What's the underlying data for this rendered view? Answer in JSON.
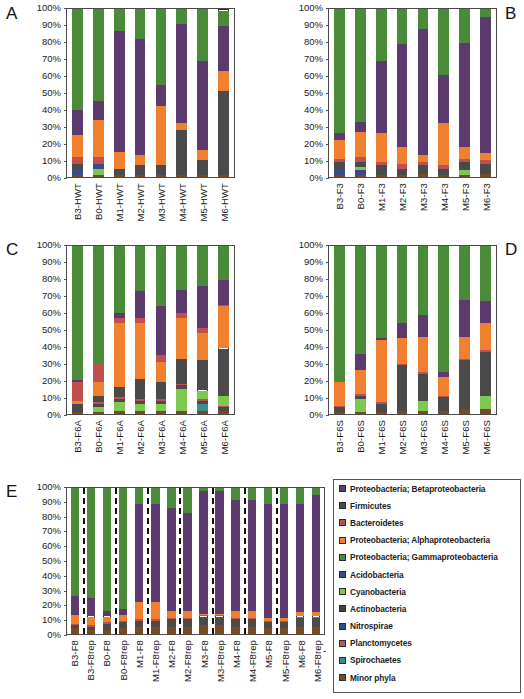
{
  "figure": {
    "panel_letters": [
      "A",
      "B",
      "C",
      "D",
      "E"
    ],
    "yticks": [
      "100%",
      "90%",
      "80%",
      "70%",
      "60%",
      "50%",
      "40%",
      "30%",
      "20%",
      "10%",
      "0%"
    ],
    "dash_marker": "-"
  },
  "legend": {
    "items": [
      {
        "label": "Proteobacteria; Betaproteobacteria",
        "color": "#5c3a6e",
        "key": "beta"
      },
      {
        "label": "Firmicutes",
        "color": "#4a4a4a",
        "key": "firmicutes"
      },
      {
        "label": "Bacteroidetes",
        "color": "#c0504d",
        "key": "bacteroidetes"
      },
      {
        "label": "Proteobacteria; Alphaproteobacteria",
        "color": "#f0802e",
        "key": "alpha"
      },
      {
        "label": "Proteobacteria; Gammaproteobacteria",
        "color": "#4a8b3a",
        "key": "gamma"
      },
      {
        "label": "Acidobacteria",
        "color": "#3b4a8c",
        "key": "acido"
      },
      {
        "label": "Cyanobacteria",
        "color": "#7ec850",
        "key": "cyano"
      },
      {
        "label": "Actinobacteria",
        "color": "#3f3f3f",
        "key": "actino"
      },
      {
        "label": "Nitrospirae",
        "color": "#2f4f7f",
        "key": "nitro"
      },
      {
        "label": "Planctomycetes",
        "color": "#b05a5a",
        "key": "plancto"
      },
      {
        "label": "Spirochaetes",
        "color": "#3d8f8f",
        "key": "spiro"
      },
      {
        "label": "Minor phyla",
        "color": "#7a4a22",
        "key": "minor"
      }
    ]
  },
  "chart_data": [
    {
      "type": "bar",
      "panel": "A",
      "title": "",
      "xlabel": "",
      "ylabel": "",
      "ylim": [
        0,
        100
      ],
      "stacked": true,
      "grid": false,
      "legend_position": "external",
      "categories": [
        "B3-HWT",
        "B0-HWT",
        "M1-HWT",
        "M2-HWT",
        "M3-HWT",
        "M4-HWT",
        "M5-HWT",
        "M6-HWT"
      ],
      "series": [
        {
          "name": "Minor phyla",
          "values": [
            1,
            1,
            1,
            1,
            1,
            1,
            1,
            1
          ]
        },
        {
          "name": "Acidobacteria",
          "values": [
            4,
            0,
            0,
            0,
            0,
            0,
            0,
            0
          ]
        },
        {
          "name": "Cyanobacteria",
          "values": [
            0,
            4,
            0,
            0,
            0,
            0,
            0,
            0
          ]
        },
        {
          "name": "Firmicutes",
          "values": [
            3,
            0,
            4,
            6,
            6,
            27,
            9,
            50
          ]
        },
        {
          "name": "Acidobacteria2",
          "values": [
            0,
            3,
            0,
            0,
            0,
            0,
            0,
            0
          ]
        },
        {
          "name": "Bacteroidetes",
          "values": [
            4,
            4,
            0,
            0,
            0,
            0,
            0,
            0
          ]
        },
        {
          "name": "Alphaproteobacteria",
          "values": [
            3,
            4,
            0,
            0,
            0,
            0,
            0,
            0
          ]
        },
        {
          "name": "Alphaproteobacteria2",
          "values": [
            10,
            18,
            10,
            6,
            35,
            4,
            6,
            12
          ]
        },
        {
          "name": "Betaproteobacteria",
          "values": [
            15,
            11,
            72,
            69,
            13,
            59,
            53,
            27
          ]
        },
        {
          "name": "Gammaproteobacteria",
          "values": [
            60,
            55,
            13,
            18,
            45,
            9,
            31,
            9
          ]
        }
      ]
    },
    {
      "type": "bar",
      "panel": "B",
      "title": "",
      "xlabel": "",
      "ylabel": "",
      "ylim": [
        0,
        100
      ],
      "stacked": true,
      "grid": false,
      "legend_position": "external",
      "categories": [
        "B3-F3",
        "B0-F3",
        "M1-F3",
        "M2-F3",
        "M3-F3",
        "M4-F3",
        "M5-F3",
        "M6-F3"
      ],
      "series": [
        {
          "name": "Minor phyla",
          "values": [
            1,
            1,
            1,
            1,
            2,
            1,
            1,
            2
          ]
        },
        {
          "name": "Acidobacteria",
          "values": [
            4,
            3,
            0,
            0,
            0,
            0,
            0,
            0
          ]
        },
        {
          "name": "Cyanobacteria",
          "values": [
            0,
            2,
            0,
            0,
            0,
            0,
            3,
            0
          ]
        },
        {
          "name": "Firmicutes",
          "values": [
            4,
            3,
            6,
            4,
            5,
            4,
            5,
            6
          ]
        },
        {
          "name": "Bacteroidetes",
          "values": [
            2,
            3,
            2,
            3,
            2,
            2,
            2,
            2
          ]
        },
        {
          "name": "Alphaproteobacteria",
          "values": [
            11,
            15,
            17,
            10,
            4,
            25,
            7,
            4
          ]
        },
        {
          "name": "Betaproteobacteria",
          "values": [
            4,
            6,
            43,
            61,
            75,
            29,
            62,
            81
          ]
        },
        {
          "name": "Gammaproteobacteria",
          "values": [
            74,
            67,
            31,
            21,
            12,
            39,
            20,
            5
          ]
        }
      ]
    },
    {
      "type": "bar",
      "panel": "C",
      "title": "",
      "xlabel": "",
      "ylabel": "",
      "ylim": [
        0,
        100
      ],
      "stacked": true,
      "grid": false,
      "legend_position": "external",
      "categories": [
        "B3-F6A",
        "B0-F6A",
        "M1-F6A",
        "M2-F6A",
        "M3-F6A",
        "M4-F6A",
        "M5-F6A",
        "M6-F6A"
      ],
      "series": [
        {
          "name": "Minor phyla",
          "values": [
            1,
            1,
            2,
            2,
            2,
            2,
            2,
            2
          ]
        },
        {
          "name": "Spirochaetes",
          "values": [
            0,
            0,
            0,
            0,
            0,
            0,
            4,
            0
          ]
        },
        {
          "name": "Cyanobacteria",
          "values": [
            0,
            3,
            5,
            4,
            4,
            13,
            0,
            0
          ]
        },
        {
          "name": "Firmicutes",
          "values": [
            3,
            2,
            2,
            2,
            2,
            2,
            2,
            2
          ]
        },
        {
          "name": "Bacteroidetes",
          "values": [
            0,
            1,
            1,
            1,
            1,
            1,
            1,
            1
          ]
        },
        {
          "name": "Cyanobacteria2",
          "values": [
            0,
            0,
            0,
            0,
            0,
            0,
            5,
            6
          ]
        },
        {
          "name": "Firmicutes2",
          "values": [
            2,
            4,
            6,
            12,
            10,
            15,
            18,
            28
          ]
        },
        {
          "name": "Alphaproteobacteria",
          "values": [
            2,
            8,
            38,
            33,
            12,
            24,
            16,
            25
          ]
        },
        {
          "name": "Bacteroidetes2",
          "values": [
            11,
            11,
            3,
            3,
            4,
            3,
            3,
            1
          ]
        },
        {
          "name": "Betaproteobacteria",
          "values": [
            1,
            0,
            3,
            16,
            29,
            14,
            25,
            15
          ]
        },
        {
          "name": "Gammaproteobacteria",
          "values": [
            80,
            70,
            40,
            27,
            36,
            26,
            24,
            20
          ]
        }
      ]
    },
    {
      "type": "bar",
      "panel": "D",
      "title": "",
      "xlabel": "",
      "ylabel": "",
      "ylim": [
        0,
        100
      ],
      "stacked": true,
      "grid": false,
      "legend_position": "external",
      "categories": [
        "B3-F6S",
        "B0-F6S",
        "M1-F6S",
        "M2-F6S",
        "M3-F6S",
        "M4-F6S",
        "M5-F6S",
        "M6-F6S"
      ],
      "series": [
        {
          "name": "Minor phyla",
          "values": [
            1,
            1,
            1,
            2,
            2,
            2,
            3,
            3
          ]
        },
        {
          "name": "Cyanobacteria",
          "values": [
            0,
            8,
            0,
            0,
            6,
            0,
            0,
            8
          ]
        },
        {
          "name": "Firmicutes",
          "values": [
            3,
            2,
            5,
            27,
            16,
            8,
            29,
            26
          ]
        },
        {
          "name": "Bacteroidetes",
          "values": [
            1,
            1,
            1,
            1,
            1,
            1,
            1,
            1
          ]
        },
        {
          "name": "Alphaproteobacteria",
          "values": [
            14,
            14,
            37,
            15,
            21,
            11,
            13,
            16
          ]
        },
        {
          "name": "Betaproteobacteria",
          "values": [
            0,
            10,
            1,
            9,
            13,
            3,
            22,
            13
          ]
        },
        {
          "name": "Gammaproteobacteria",
          "values": [
            81,
            64,
            55,
            46,
            41,
            75,
            32,
            33
          ]
        }
      ]
    },
    {
      "type": "bar",
      "panel": "E",
      "title": "",
      "xlabel": "",
      "ylabel": "",
      "ylim": [
        0,
        100
      ],
      "stacked": true,
      "grid": false,
      "legend_position": "external",
      "separators_after": [
        1,
        3,
        5,
        7,
        9,
        11,
        13
      ],
      "categories": [
        "B3-F8",
        "B3-F8rep",
        "B0-F8",
        "B0-F8rep",
        "M1-F8",
        "M1-F8rep",
        "M2-F8",
        "M2-F8rep",
        "M3-F8",
        "M3-F8rep",
        "M4-F8",
        "M4-F8rep",
        "M5-F8",
        "M5-F8rep",
        "M6-F8",
        "M6-F8rep"
      ],
      "series": [
        {
          "name": "Minor phyla",
          "values": [
            4,
            3,
            3,
            4,
            5,
            5,
            5,
            5,
            6,
            6,
            5,
            5,
            4,
            4,
            5,
            5
          ]
        },
        {
          "name": "Firmicutes",
          "values": [
            2,
            2,
            4,
            4,
            4,
            4,
            5,
            5,
            6,
            6,
            5,
            5,
            4,
            4,
            6,
            6
          ]
        },
        {
          "name": "Bacteroidetes",
          "values": [
            1,
            1,
            1,
            1,
            1,
            1,
            1,
            1,
            1,
            1,
            1,
            1,
            1,
            1,
            1,
            1
          ]
        },
        {
          "name": "Alphaproteobacteria",
          "values": [
            6,
            6,
            4,
            4,
            12,
            12,
            5,
            5,
            1,
            1,
            5,
            5,
            2,
            2,
            3,
            3
          ]
        },
        {
          "name": "Betaproteobacteria",
          "values": [
            13,
            13,
            4,
            4,
            67,
            67,
            70,
            67,
            84,
            84,
            76,
            76,
            78,
            78,
            74,
            80
          ]
        },
        {
          "name": "Gammaproteobacteria",
          "values": [
            74,
            75,
            84,
            83,
            11,
            11,
            14,
            17,
            2,
            2,
            8,
            8,
            11,
            11,
            11,
            5
          ]
        }
      ]
    }
  ]
}
